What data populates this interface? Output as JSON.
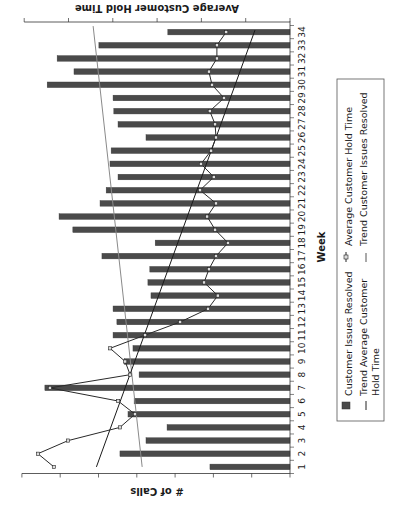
{
  "chart_data": {
    "type": "bar",
    "combo": "bar + line (dual axis)",
    "orientation_note": "Entire chart image rotated 90 degrees counter-clockwise",
    "title": "",
    "xlabel": "Week",
    "ylabel": "# of Calls",
    "y2label": "Average Customer Hold Time",
    "y_ticks_count": 8,
    "y2_ticks_count": 7,
    "y_tick_labels_visible": false,
    "ylim": [
      0,
      7
    ],
    "y2lim": [
      0,
      6
    ],
    "grid": false,
    "legend_position": "bottom (right side of rotated image)",
    "categories": [
      "1",
      "2",
      "3",
      "4",
      "5",
      "6",
      "7",
      "8",
      "9",
      "10",
      "11",
      "12",
      "13",
      "14",
      "15",
      "16",
      "17",
      "18",
      "19",
      "20",
      "21",
      "22",
      "23",
      "24",
      "25",
      "26",
      "27",
      "28",
      "29",
      "30",
      "31",
      "32",
      "33",
      "34"
    ],
    "series": [
      {
        "name": "Customer Issues Resolved",
        "type": "bar",
        "axis": "primary",
        "color": "#4a4a4a",
        "values": [
          2.09,
          4.44,
          3.76,
          3.21,
          4.23,
          4.07,
          6.4,
          3.94,
          4.33,
          4.1,
          4.62,
          4.52,
          4.62,
          3.63,
          3.71,
          3.66,
          4.91,
          3.52,
          5.67,
          6.03,
          4.96,
          4.8,
          4.49,
          4.7,
          4.67,
          3.76,
          4.49,
          4.6,
          4.62,
          6.34,
          5.64,
          6.08,
          4.99,
          3.19
        ]
      },
      {
        "name": "Average Customer Hold Time",
        "type": "line",
        "axis": "secondary",
        "marker": "square",
        "color": "#2a2a2a",
        "values": [
          5.33,
          5.69,
          5.01,
          3.84,
          3.5,
          3.88,
          5.42,
          3.61,
          3.72,
          4.06,
          3.27,
          2.48,
          1.85,
          1.63,
          1.94,
          1.83,
          1.67,
          1.4,
          1.69,
          1.87,
          1.67,
          2.03,
          1.72,
          2.01,
          1.78,
          1.67,
          1.69,
          1.81,
          1.49,
          1.76,
          1.83,
          1.65,
          1.65,
          1.44
        ]
      },
      {
        "name": "Trend Average Customer Hold Time",
        "type": "line",
        "axis": "secondary",
        "color": "#1a1a1a",
        "start": 4.37,
        "end": 0.79
      },
      {
        "name": "Trend Customer Issues Resolved",
        "type": "line",
        "axis": "primary",
        "color": "#8a8a8a",
        "start": 3.86,
        "end": 5.14
      }
    ]
  },
  "labels": {
    "x_axis_title": "Week",
    "y_axis_title": "# of Calls",
    "y2_axis_title": "Average Customer Hold Time"
  },
  "legend": {
    "items": [
      {
        "label": "Customer Issues Resolved",
        "symbol": "bar"
      },
      {
        "label": "Average Customer Hold Time",
        "symbol": "line-marker"
      },
      {
        "label_line1": "Trend Average Customer",
        "label_line2": "Hold Time",
        "symbol": "line"
      },
      {
        "label": "Trend Customer Issues Resolved",
        "symbol": "line"
      }
    ]
  }
}
